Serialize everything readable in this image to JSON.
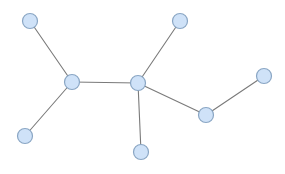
{
  "diagram": {
    "type": "graph",
    "width": 285,
    "height": 174,
    "colors": {
      "background": "#ffffff",
      "node_fill": "#cfe2f8",
      "node_stroke": "#8aa6c4",
      "edge": "#7a7a7a"
    },
    "node_radius": 7.5,
    "node_stroke_width": 1.2,
    "edge_width": 1.1,
    "nodes": [
      {
        "id": "n0",
        "x": 30,
        "y": 21
      },
      {
        "id": "n1",
        "x": 72,
        "y": 82
      },
      {
        "id": "n2",
        "x": 25,
        "y": 136
      },
      {
        "id": "n3",
        "x": 138,
        "y": 83
      },
      {
        "id": "n4",
        "x": 180,
        "y": 21
      },
      {
        "id": "n5",
        "x": 141,
        "y": 152
      },
      {
        "id": "n6",
        "x": 206,
        "y": 115
      },
      {
        "id": "n7",
        "x": 264,
        "y": 76
      }
    ],
    "edges": [
      {
        "source": "n0",
        "target": "n1"
      },
      {
        "source": "n1",
        "target": "n2"
      },
      {
        "source": "n1",
        "target": "n3"
      },
      {
        "source": "n3",
        "target": "n4"
      },
      {
        "source": "n3",
        "target": "n5"
      },
      {
        "source": "n3",
        "target": "n6"
      },
      {
        "source": "n6",
        "target": "n7"
      }
    ]
  }
}
